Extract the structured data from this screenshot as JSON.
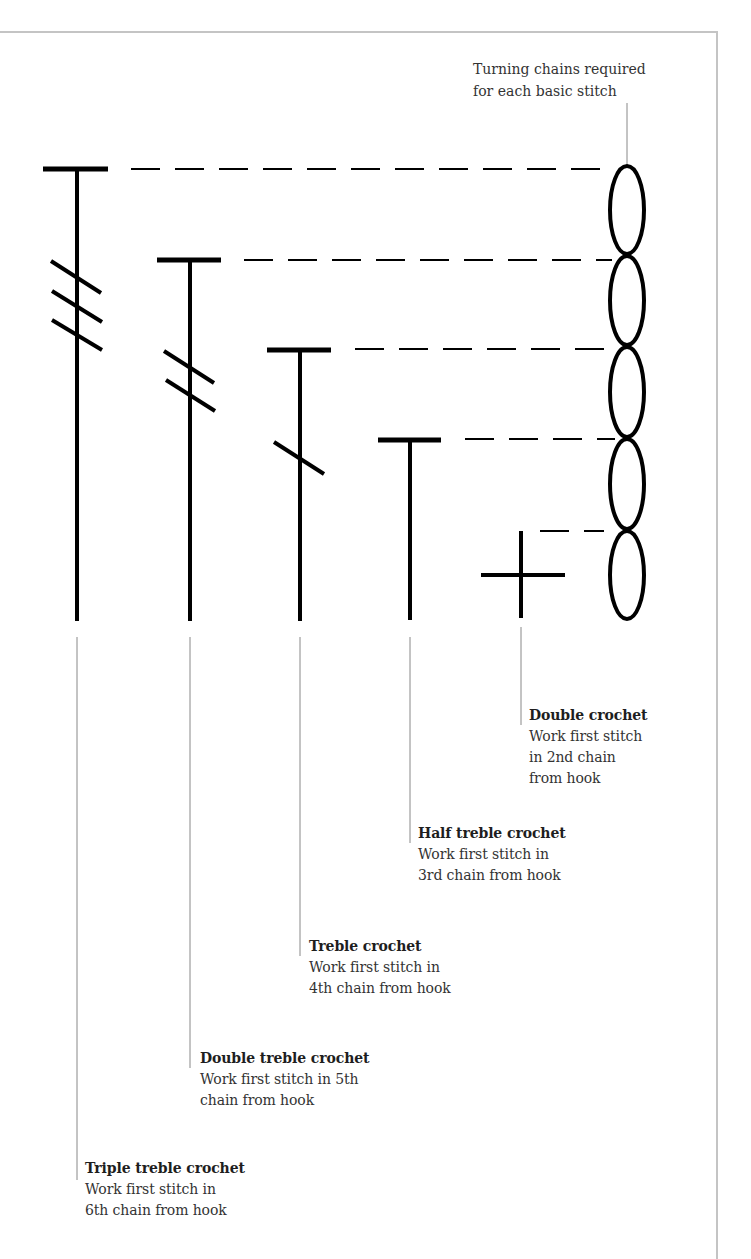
{
  "colors": {
    "stroke": "#000000",
    "leader": "#888888",
    "frame": "#c4c4c4",
    "text": "#333333"
  },
  "turning_chains_label": {
    "line1": "Turning chains required",
    "line2": "for each basic stitch"
  },
  "chain": {
    "cx": 627,
    "rx": 17,
    "ovals": [
      {
        "top": 165,
        "bottom": 255
      },
      {
        "top": 255,
        "bottom": 346
      },
      {
        "top": 346,
        "bottom": 438
      },
      {
        "top": 438,
        "bottom": 530
      },
      {
        "top": 530,
        "bottom": 620
      }
    ],
    "connector": {
      "x": 627,
      "y1": 103,
      "y2": 165
    }
  },
  "stitches": [
    {
      "id": "triple-treble",
      "symbol": "T-with-3-slashes",
      "stem_x": 77,
      "top_y": 169,
      "bottom_y": 621,
      "bar_x1": 43,
      "bar_x2": 108,
      "slashes": [
        [
          51,
          261,
          101,
          293
        ],
        [
          52,
          291,
          102,
          322
        ],
        [
          52,
          320,
          102,
          350
        ]
      ],
      "dash_y": 169,
      "dash_x1": 131,
      "dash_x2": 612,
      "leader": {
        "x": 77,
        "y1": 637,
        "y2": 1180
      },
      "label": {
        "x": 85,
        "y": 1158,
        "title": "Triple treble crochet",
        "lines": [
          "Work first stitch in",
          "6th chain from hook"
        ]
      }
    },
    {
      "id": "double-treble",
      "symbol": "T-with-2-slashes",
      "stem_x": 190,
      "top_y": 260,
      "bottom_y": 621,
      "bar_x1": 157,
      "bar_x2": 221,
      "slashes": [
        [
          164,
          351,
          214,
          383
        ],
        [
          166,
          380,
          215,
          411
        ]
      ],
      "dash_y": 260,
      "dash_x1": 244,
      "dash_x2": 612,
      "leader": {
        "x": 190,
        "y1": 637,
        "y2": 1068
      },
      "label": {
        "x": 200,
        "y": 1048,
        "title": "Double treble crochet",
        "lines": [
          "Work first stitch in 5th",
          "chain from hook"
        ]
      }
    },
    {
      "id": "treble",
      "symbol": "T-with-1-slash",
      "stem_x": 300,
      "top_y": 350,
      "bottom_y": 621,
      "bar_x1": 267,
      "bar_x2": 331,
      "slashes": [
        [
          274,
          442,
          324,
          474
        ]
      ],
      "dash_y": 349,
      "dash_x1": 355,
      "dash_x2": 612,
      "leader": {
        "x": 300,
        "y1": 637,
        "y2": 956
      },
      "label": {
        "x": 309,
        "y": 936,
        "title": "Treble crochet",
        "lines": [
          "Work first stitch in",
          "4th chain from hook"
        ]
      }
    },
    {
      "id": "half-treble",
      "symbol": "T",
      "stem_x": 410,
      "top_y": 440,
      "bottom_y": 620,
      "bar_x1": 378,
      "bar_x2": 441,
      "slashes": [],
      "dash_y": 439,
      "dash_x1": 465,
      "dash_x2": 615,
      "leader": {
        "x": 410,
        "y1": 637,
        "y2": 843
      },
      "label": {
        "x": 418,
        "y": 823,
        "title": "Half treble crochet",
        "lines": [
          "Work first stitch in",
          "3rd chain from hook"
        ]
      }
    },
    {
      "id": "double",
      "symbol": "cross",
      "stem_x": 521,
      "top_y": 531,
      "bottom_y": 618,
      "cross_y": 575,
      "cross_x1": 481,
      "cross_x2": 565,
      "slashes": [],
      "dash_y": 531,
      "dash_x1": 540,
      "dash_x2": 604,
      "leader": {
        "x": 521,
        "y1": 627,
        "y2": 725
      },
      "label": {
        "x": 529,
        "y": 705,
        "title": "Double crochet",
        "lines": [
          "Work first stitch",
          "in 2nd chain",
          "from hook"
        ]
      }
    }
  ]
}
